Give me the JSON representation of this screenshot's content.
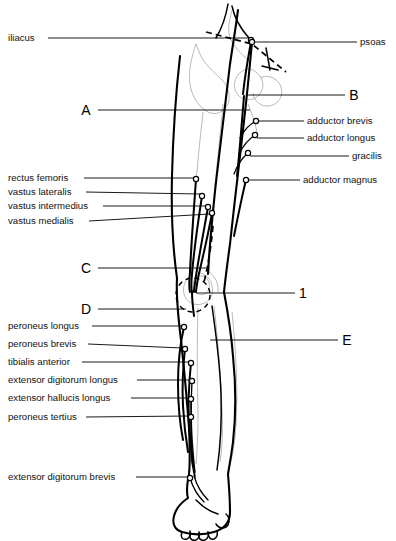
{
  "figure": {
    "view": "anterior right lower limb",
    "line_color": "#000000",
    "bone_color": "#b9b9b9",
    "background": "#ffffff"
  },
  "labels_left": [
    {
      "id": "iliacus",
      "text": "iliacus",
      "x": 8,
      "y": 41,
      "line_x1": 48,
      "line_y1": 38,
      "line_x2": 250,
      "line_y2": 38,
      "dot_x": 251,
      "dot_y": 40
    },
    {
      "id": "rectus-femoris",
      "text": "rectus femoris",
      "x": 8,
      "y": 181,
      "line_x1": 84,
      "line_y1": 178,
      "line_x2": 194,
      "line_y2": 178,
      "dot_x": 196,
      "dot_y": 179
    },
    {
      "id": "vastus-lateralis",
      "text": "vastus lateralis",
      "x": 8,
      "y": 195,
      "line_x1": 86,
      "line_y1": 192,
      "line_x2": 200,
      "line_y2": 194,
      "dot_x": 202,
      "dot_y": 196
    },
    {
      "id": "vastus-intermedius",
      "text": "vastus intermedius",
      "x": 8,
      "y": 209,
      "line_x1": 103,
      "line_y1": 206,
      "line_x2": 206,
      "line_y2": 206,
      "dot_x": 208,
      "dot_y": 207
    },
    {
      "id": "vastus-medialis",
      "text": "vastus medialis",
      "x": 8,
      "y": 224,
      "line_x1": 89,
      "line_y1": 221,
      "line_x2": 210,
      "line_y2": 214,
      "dot_x": 212,
      "dot_y": 213
    },
    {
      "id": "peroneus-longus",
      "text": "peroneus longus",
      "x": 8,
      "y": 329,
      "line_x1": 92,
      "line_y1": 326,
      "line_x2": 182,
      "line_y2": 326,
      "dot_x": 184,
      "dot_y": 327
    },
    {
      "id": "peroneus-brevis",
      "text": "peroneus brevis",
      "x": 8,
      "y": 347,
      "line_x1": 88,
      "line_y1": 344,
      "line_x2": 183,
      "line_y2": 348,
      "dot_x": 185,
      "dot_y": 349
    },
    {
      "id": "tibialis-anterior",
      "text": "tibialis anterior",
      "x": 8,
      "y": 365,
      "line_x1": 82,
      "line_y1": 362,
      "line_x2": 189,
      "line_y2": 362,
      "dot_x": 191,
      "dot_y": 363
    },
    {
      "id": "extensor-digitorum-longus",
      "text": "extensor digitorum longus",
      "x": 8,
      "y": 383,
      "line_x1": 137,
      "line_y1": 380,
      "line_x2": 190,
      "line_y2": 380,
      "dot_x": 192,
      "dot_y": 381
    },
    {
      "id": "extensor-hallucis-longus",
      "text": "extensor hallucis longus",
      "x": 8,
      "y": 401,
      "line_x1": 131,
      "line_y1": 398,
      "line_x2": 189,
      "line_y2": 398,
      "dot_x": 191,
      "dot_y": 399
    },
    {
      "id": "peroneus-tertius",
      "text": "peroneus tertius",
      "x": 8,
      "y": 420,
      "line_x1": 86,
      "line_y1": 417,
      "line_x2": 189,
      "line_y2": 416,
      "dot_x": 191,
      "dot_y": 417
    },
    {
      "id": "extensor-digitorum-brevis",
      "text": "extensor digitorum brevis",
      "x": 8,
      "y": 480,
      "line_x1": 136,
      "line_y1": 477,
      "line_x2": 188,
      "line_y2": 477,
      "dot_x": 190,
      "dot_y": 478
    }
  ],
  "labels_right": [
    {
      "id": "psoas",
      "text": "psoas",
      "x": 360,
      "y": 45,
      "line_x1": 253,
      "line_y1": 42,
      "line_x2": 357,
      "line_y2": 42,
      "dot_x": 252,
      "dot_y": 42
    },
    {
      "id": "adductor-brevis",
      "text": "adductor brevis",
      "x": 307,
      "y": 124,
      "line_x1": 258,
      "line_y1": 121,
      "line_x2": 304,
      "line_y2": 121,
      "dot_x": 256,
      "dot_y": 121
    },
    {
      "id": "adductor-longus",
      "text": "adductor longus",
      "x": 307,
      "y": 141,
      "line_x1": 257,
      "line_y1": 138,
      "line_x2": 304,
      "line_y2": 138,
      "dot_x": 255,
      "dot_y": 135
    },
    {
      "id": "gracilis",
      "text": "gracilis",
      "x": 352,
      "y": 159,
      "line_x1": 250,
      "line_y1": 156,
      "line_x2": 349,
      "line_y2": 156,
      "dot_x": 248,
      "dot_y": 153
    },
    {
      "id": "adductor-magnus",
      "text": "adductor magnus",
      "x": 303,
      "y": 183,
      "line_x1": 248,
      "line_y1": 180,
      "line_x2": 300,
      "line_y2": 180,
      "dot_x": 246,
      "dot_y": 180
    }
  ],
  "markers": [
    {
      "id": "marker-a",
      "text": "A",
      "x": 86,
      "y": 115,
      "line_x1": 98,
      "line_y1": 110,
      "line_x2": 250,
      "line_y2": 110
    },
    {
      "id": "marker-b",
      "text": "B",
      "x": 354,
      "y": 100,
      "line_x1": 246,
      "line_y1": 95,
      "line_x2": 345,
      "line_y2": 95
    },
    {
      "id": "marker-c",
      "text": "C",
      "x": 86,
      "y": 273,
      "line_x1": 98,
      "line_y1": 268,
      "line_x2": 206,
      "line_y2": 268
    },
    {
      "id": "marker-d",
      "text": "D",
      "x": 86,
      "y": 314,
      "line_x1": 98,
      "line_y1": 309,
      "line_x2": 186,
      "line_y2": 309
    },
    {
      "id": "marker-1",
      "text": "1",
      "x": 303,
      "y": 298,
      "line_x1": 196,
      "line_y1": 293,
      "line_x2": 295,
      "line_y2": 293
    },
    {
      "id": "marker-e",
      "text": "E",
      "x": 347,
      "y": 345,
      "line_x1": 210,
      "line_y1": 340,
      "line_x2": 338,
      "line_y2": 340
    }
  ]
}
